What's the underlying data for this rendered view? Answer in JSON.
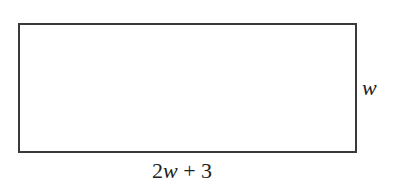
{
  "diagram": {
    "shape": "rectangle",
    "labels": {
      "height": "w",
      "base_coefficient": "2",
      "base_variable": "w",
      "base_rest": " + 3"
    },
    "stroke_color": "#3a3a3a"
  }
}
